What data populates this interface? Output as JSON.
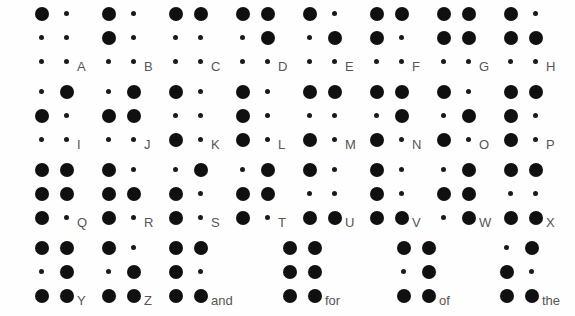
{
  "chart": {
    "background_color": "#fefefe",
    "dot_color": "#101010",
    "label_color": "#555555",
    "rows": [
      {
        "row_index": 0,
        "entries": [
          {
            "label": "A",
            "dots": [
              1
            ]
          },
          {
            "label": "B",
            "dots": [
              1,
              2
            ]
          },
          {
            "label": "C",
            "dots": [
              1,
              4
            ]
          },
          {
            "label": "D",
            "dots": [
              1,
              4,
              5
            ]
          },
          {
            "label": "E",
            "dots": [
              1,
              5
            ]
          },
          {
            "label": "F",
            "dots": [
              1,
              2,
              4
            ]
          },
          {
            "label": "G",
            "dots": [
              1,
              2,
              4,
              5
            ]
          },
          {
            "label": "H",
            "dots": [
              1,
              2,
              5
            ]
          }
        ]
      },
      {
        "row_index": 1,
        "entries": [
          {
            "label": "I",
            "dots": [
              2,
              4
            ]
          },
          {
            "label": "J",
            "dots": [
              2,
              4,
              5
            ]
          },
          {
            "label": "K",
            "dots": [
              1,
              3
            ]
          },
          {
            "label": "L",
            "dots": [
              1,
              2,
              3
            ]
          },
          {
            "label": "M",
            "dots": [
              1,
              3,
              4
            ]
          },
          {
            "label": "N",
            "dots": [
              1,
              3,
              4,
              5
            ]
          },
          {
            "label": "O",
            "dots": [
              1,
              3,
              5
            ]
          },
          {
            "label": "P",
            "dots": [
              1,
              2,
              3,
              4
            ]
          }
        ]
      },
      {
        "row_index": 2,
        "entries": [
          {
            "label": "Q",
            "dots": [
              1,
              2,
              3,
              4,
              5
            ]
          },
          {
            "label": "R",
            "dots": [
              1,
              2,
              3,
              5
            ]
          },
          {
            "label": "S",
            "dots": [
              2,
              3,
              4
            ]
          },
          {
            "label": "T",
            "dots": [
              2,
              3,
              4,
              5
            ]
          },
          {
            "label": "U",
            "dots": [
              1,
              3,
              6
            ]
          },
          {
            "label": "V",
            "dots": [
              1,
              2,
              3,
              6
            ]
          },
          {
            "label": "W",
            "dots": [
              2,
              4,
              5,
              6
            ]
          },
          {
            "label": "X",
            "dots": [
              1,
              3,
              4,
              6
            ]
          }
        ]
      },
      {
        "row_index": 3,
        "entries": [
          {
            "label": "Y",
            "dots": [
              1,
              3,
              4,
              5,
              6
            ]
          },
          {
            "label": "Z",
            "dots": [
              1,
              3,
              5,
              6
            ]
          },
          {
            "label": "and",
            "dots": [
              1,
              2,
              3,
              4,
              6
            ]
          },
          {
            "label": "for",
            "dots": [
              1,
              2,
              3,
              4,
              5,
              6
            ]
          },
          {
            "label": "of",
            "dots": [
              1,
              3,
              4,
              5,
              6
            ]
          },
          {
            "label": "the",
            "dots": [
              2,
              3,
              4,
              6
            ]
          }
        ]
      }
    ]
  }
}
